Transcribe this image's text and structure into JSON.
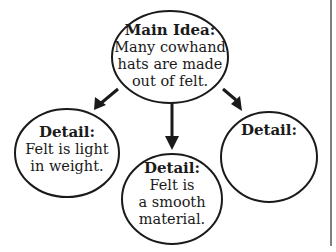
{
  "diagram": {
    "type": "main-idea-and-details web",
    "colors": {
      "stroke": "#1a1a1a",
      "background": "#ffffff",
      "border": "#555555"
    },
    "main_idea": {
      "title": "Main Idea:",
      "body": "Many cowhand\nhats are made\nout of felt."
    },
    "details": [
      {
        "title": "Detail:",
        "body": "Felt is light\nin weight."
      },
      {
        "title": "Detail:",
        "body": "Felt is\na smooth\nmaterial."
      },
      {
        "title": "Detail:",
        "body": ""
      }
    ],
    "arrows": [
      {
        "from": "main_idea",
        "to": "details.0"
      },
      {
        "from": "main_idea",
        "to": "details.1"
      },
      {
        "from": "main_idea",
        "to": "details.2"
      }
    ]
  }
}
